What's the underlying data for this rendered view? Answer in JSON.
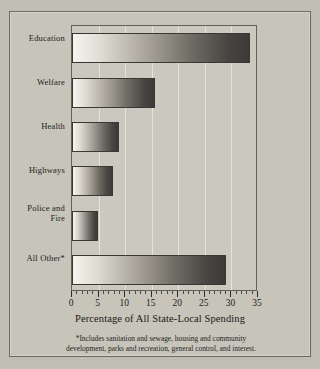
{
  "chart_data": {
    "type": "bar",
    "orientation": "horizontal",
    "title": "",
    "xlabel": "Percentage of All State-Local Spending",
    "ylabel": "",
    "categories": [
      "Education",
      "Welfare",
      "Health",
      "Highways",
      "Police and Fire",
      "All Other*"
    ],
    "values": [
      33.5,
      15.7,
      8.9,
      7.7,
      4.9,
      28.9
    ],
    "xlim": [
      0,
      35
    ],
    "xticks": [
      0,
      5,
      10,
      15,
      20,
      25,
      30,
      35
    ],
    "xticklabels": [
      "0",
      "5",
      "10",
      "15",
      "20",
      "25",
      "30",
      "35"
    ],
    "minor_tick_step": 1,
    "grid": true,
    "grid_axis": "x",
    "legend": false,
    "bar_fill": "gradient-light-to-dark-left-to-right",
    "bar_edge_color": "#3a3833",
    "plot_background": "#cbc8bf",
    "page_background": "#c2bfb5"
  },
  "footnote": {
    "line1": "*Includes sanitation and sewage, housing and community",
    "line2": "development, parks and recreation, general control, and interest."
  },
  "ylabels": [
    {
      "line1": "Education",
      "line2": ""
    },
    {
      "line1": "Welfare",
      "line2": ""
    },
    {
      "line1": "Health",
      "line2": ""
    },
    {
      "line1": "Highways",
      "line2": ""
    },
    {
      "line1": "Police and",
      "line2": "Fire"
    },
    {
      "line1": "All Other*",
      "line2": ""
    }
  ]
}
